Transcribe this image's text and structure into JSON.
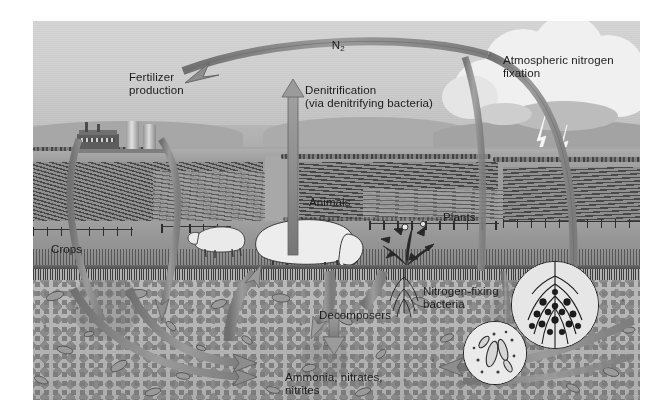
{
  "figure": {
    "style": "grayscale scientific illustration of a farm landscape cross-section"
  },
  "labels": {
    "n2": "N",
    "n2_sub": "2",
    "fertilizer_production": "Fertilizer\nproduction",
    "denitrification": "Denitrification\n(via denitrifying bacteria)",
    "atmospheric_fixation": "Atmospheric nitrogen\nfixation",
    "animals": "Animals",
    "plants": "Plants",
    "crops": "Crops",
    "decomposers": "Decomposers",
    "nitrogen_fixing_bacteria": "Nitrogen-fixing\nbacteria",
    "ammonia_nitrates_nitrites": "Ammonia, nitrates,\nnitrites"
  },
  "scene": {
    "sky": "sky",
    "hills": "distant-hills",
    "fields": "plowed-fields",
    "pasture": "grazing-pasture",
    "soil": "soil-cross-section",
    "cloud": "thundercloud",
    "lightning": "lightning-bolts",
    "factory": "fertilizer-factory",
    "silos": "storage-silos",
    "sheep_large": "grazing-sheep",
    "sheep_small": "grazing-sheep",
    "shrub": "flowering-plant",
    "root_inset": "root-nodule-inset",
    "bacteria_inset": "bacteria-inset"
  },
  "arrows": {
    "n2_to_fertilizer": "N2-to-fertilizer-production-arrow",
    "denitrification_up": "denitrification-up-arrow",
    "lightning_to_soil": "atmospheric-fixation-down-arrow",
    "fertilizer_to_soil": "fertilizer-to-soil-arrow",
    "crops_to_soil": "crops-uptake-arrow",
    "soil_to_crops": "soil-to-crops-arrow",
    "animals_to_soil": "animals-to-soil-arrow",
    "plants_to_soil": "plants-to-soil-arrow",
    "decomposers_down": "decomposers-to-ammonia-arrow",
    "soil_cycle_left": "soil-cycle-left-arrow",
    "soil_cycle_right": "soil-cycle-right-arrow"
  },
  "colors": {
    "sky": "#d0d2cf",
    "field": "#989a96",
    "soil": "#b9b7b0",
    "arrow": "#8c8e8a",
    "arrow_stroke": "#6f716d",
    "text": "#1a1a1a",
    "cloud": "#f2f3f1"
  }
}
